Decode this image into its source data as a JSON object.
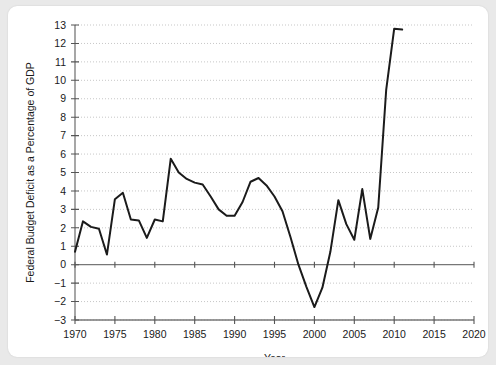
{
  "chart_data": {
    "type": "line",
    "title": "",
    "xlabel": "Year",
    "ylabel": "Federal Budget Deficit as a Percentage of GDP",
    "xlim": [
      1970,
      2020
    ],
    "ylim": [
      -3,
      13
    ],
    "xticks": [
      1970,
      1975,
      1980,
      1985,
      1990,
      1995,
      2000,
      2005,
      2010,
      2015,
      2020
    ],
    "yticks": [
      -3,
      -2,
      -1,
      0,
      1,
      2,
      3,
      4,
      5,
      6,
      7,
      8,
      9,
      10,
      11,
      12,
      13
    ],
    "xtick_labels": [
      "1970",
      "1975",
      "1980",
      "1985",
      "1990",
      "1995",
      "2000",
      "2005",
      "2010",
      "2015",
      "2020"
    ],
    "ytick_labels": [
      "-3",
      "-2",
      "-1",
      "0",
      "1",
      "2",
      "3",
      "4",
      "5",
      "6",
      "7",
      "8",
      "9",
      "10",
      "11",
      "12",
      "13"
    ],
    "grid": true,
    "legend": null,
    "line_color": "#1b1b1b",
    "x": [
      1970,
      1971,
      1972,
      1973,
      1974,
      1975,
      1976,
      1977,
      1978,
      1979,
      1980,
      1981,
      1982,
      1983,
      1984,
      1985,
      1986,
      1987,
      1988,
      1989,
      1990,
      1991,
      1992,
      1993,
      1994,
      1995,
      1996,
      1997,
      1998,
      1999,
      2000,
      2001,
      2002,
      2003,
      2004,
      2005,
      2006,
      2007,
      2008,
      2009,
      2010,
      2011
    ],
    "values": [
      0.7,
      2.35,
      2.05,
      1.95,
      0.55,
      3.55,
      3.9,
      2.45,
      2.4,
      1.45,
      2.45,
      2.35,
      5.75,
      5.0,
      4.65,
      4.45,
      4.35,
      3.7,
      3.0,
      2.65,
      2.65,
      3.4,
      4.5,
      4.7,
      4.3,
      3.7,
      2.9,
      1.5,
      0.0,
      -1.2,
      -2.3,
      -1.25,
      0.7,
      3.5,
      2.2,
      1.35,
      4.1,
      1.4,
      3.1,
      9.5,
      12.8,
      12.75
    ]
  },
  "icons": {
    "chart_canvas": "line-chart-icon"
  }
}
